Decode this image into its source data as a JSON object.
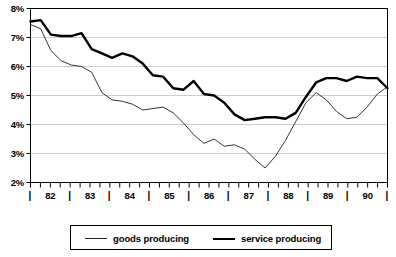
{
  "chart_data": {
    "type": "line",
    "title": "",
    "subtitle": "",
    "xlabel": "",
    "ylabel": "",
    "ylim": [
      2,
      8
    ],
    "ytick_labels": [
      "8%",
      "7%",
      "6%",
      "5%",
      "4%",
      "3%",
      "2%"
    ],
    "ytick_values": [
      8,
      7,
      6,
      5,
      4,
      3,
      2
    ],
    "grid": true,
    "grid_axis": "y",
    "legend_position": "bottom",
    "xtick_labels": [
      "82",
      "83",
      "84",
      "85",
      "86",
      "87",
      "88",
      "89",
      "90"
    ],
    "x_minor_ticks_per_year": 4,
    "x": [
      "82Q1",
      "82Q2",
      "82Q3",
      "82Q4",
      "83Q1",
      "83Q2",
      "83Q3",
      "83Q4",
      "84Q1",
      "84Q2",
      "84Q3",
      "84Q4",
      "85Q1",
      "85Q2",
      "85Q3",
      "85Q4",
      "86Q1",
      "86Q2",
      "86Q3",
      "86Q4",
      "87Q1",
      "87Q2",
      "87Q3",
      "87Q4",
      "88Q1",
      "88Q2",
      "88Q3",
      "88Q4",
      "89Q1",
      "89Q2",
      "89Q3",
      "89Q4",
      "90Q1",
      "90Q2",
      "90Q3",
      "90Q4"
    ],
    "series": [
      {
        "name": "goods producing",
        "style": "thin",
        "color": "#333333",
        "values": [
          7.45,
          7.3,
          6.55,
          6.2,
          6.05,
          6.0,
          5.8,
          5.1,
          4.85,
          4.8,
          4.7,
          4.5,
          4.55,
          4.6,
          4.4,
          4.05,
          3.65,
          3.35,
          3.5,
          3.25,
          3.3,
          3.15,
          2.8,
          2.5,
          2.9,
          3.45,
          4.1,
          4.75,
          5.1,
          4.85,
          4.45,
          4.2,
          4.25,
          4.6,
          5.05,
          5.3
        ]
      },
      {
        "name": "service producing",
        "style": "thick",
        "color": "#000000",
        "values": [
          7.55,
          7.6,
          7.1,
          7.05,
          7.05,
          7.15,
          6.6,
          6.45,
          6.3,
          6.45,
          6.35,
          6.1,
          5.7,
          5.65,
          5.25,
          5.2,
          5.5,
          5.05,
          5.0,
          4.75,
          4.35,
          4.15,
          4.2,
          4.25,
          4.25,
          4.2,
          4.4,
          4.95,
          5.45,
          5.6,
          5.6,
          5.5,
          5.65,
          5.6,
          5.6,
          5.25
        ]
      }
    ]
  },
  "legend": {
    "entries": [
      {
        "label": "goods producing"
      },
      {
        "label": "service producing"
      }
    ]
  },
  "axis": {
    "year_separator": "|"
  }
}
